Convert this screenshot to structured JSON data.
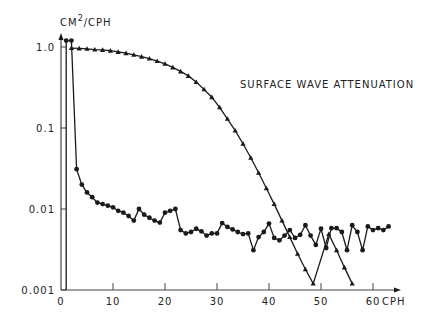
{
  "chart_data": {
    "type": "line",
    "title": "",
    "annotation": "SURFACE WAVE ATTENUATION",
    "xlabel": "CPH",
    "ylabel": "CM²/CPH",
    "ylabel_base": "CM",
    "ylabel_sup": "2",
    "ylabel_rest": "/CPH",
    "xscale": "linear",
    "yscale": "log",
    "xlim": [
      0,
      65
    ],
    "ylim": [
      0.001,
      1.3
    ],
    "xticks": [
      0,
      10,
      20,
      30,
      40,
      50,
      60
    ],
    "xtick_labels": [
      "0",
      "10",
      "20",
      "30",
      "40",
      "50",
      "60"
    ],
    "yticks": [
      1.0,
      0.1,
      0.01,
      0.001
    ],
    "ytick_labels": [
      "1.0",
      "0.1",
      "0.01",
      "0.001"
    ],
    "grid": false,
    "legend": null,
    "series": [
      {
        "name": "Surface wave attenuation",
        "marker": "triangle",
        "x": [
          2,
          3.5,
          5,
          6.5,
          8,
          9.5,
          11,
          12.5,
          14,
          15.5,
          17,
          18.5,
          20,
          21.5,
          23,
          24.5,
          26,
          27.5,
          29,
          30.5,
          32,
          33.5,
          35,
          36.5,
          38,
          39.5,
          41,
          42.5,
          44,
          45.5,
          47,
          48.5,
          50,
          51.5,
          53,
          54.5,
          56
        ],
        "y": [
          0.97,
          0.96,
          0.95,
          0.93,
          0.92,
          0.9,
          0.87,
          0.84,
          0.8,
          0.76,
          0.72,
          0.67,
          0.62,
          0.56,
          0.5,
          0.44,
          0.37,
          0.3,
          0.24,
          0.18,
          0.13,
          0.093,
          0.064,
          0.043,
          0.028,
          0.018,
          0.0115,
          0.0072,
          0.0045,
          0.0028,
          0.0018,
          0.0012,
          0.0076,
          0.0049,
          0.0031,
          0.0019,
          0.0012
        ]
      },
      {
        "name": "Measured spectrum",
        "marker": "circle",
        "x": [
          1,
          2,
          3,
          4,
          5,
          6,
          7,
          8,
          9,
          10,
          11,
          12,
          13,
          14,
          15,
          16,
          17,
          18,
          19,
          20,
          21,
          22,
          23,
          24,
          25,
          26,
          27,
          28,
          29,
          30,
          31,
          32,
          33,
          34,
          35,
          36,
          37,
          38,
          39,
          40,
          41,
          42,
          43,
          44,
          45,
          46,
          47,
          48,
          49,
          50,
          51,
          52,
          53,
          54,
          55,
          56,
          57,
          58,
          59,
          60,
          61,
          62,
          63
        ],
        "y": [
          1.2,
          1.2,
          0.031,
          0.02,
          0.016,
          0.014,
          0.012,
          0.0115,
          0.011,
          0.0105,
          0.0095,
          0.009,
          0.0082,
          0.0072,
          0.01,
          0.0085,
          0.0078,
          0.0072,
          0.0068,
          0.009,
          0.0095,
          0.01,
          0.0055,
          0.005,
          0.0052,
          0.0057,
          0.0053,
          0.0047,
          0.005,
          0.005,
          0.0067,
          0.006,
          0.0056,
          0.0052,
          0.0049,
          0.005,
          0.0031,
          0.0045,
          0.0052,
          0.0066,
          0.0044,
          0.0041,
          0.0047,
          0.0055,
          0.0044,
          0.0048,
          0.0063,
          0.0047,
          0.0036,
          0.0057,
          0.0033,
          0.0058,
          0.0058,
          0.0052,
          0.0031,
          0.0063,
          0.0052,
          0.0031,
          0.0061,
          0.0055,
          0.0058,
          0.0055,
          0.0061
        ]
      }
    ]
  }
}
